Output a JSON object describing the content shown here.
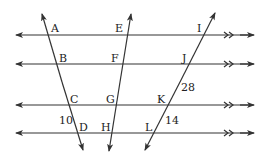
{
  "diagram": {
    "type": "parallel lines cut by transversals",
    "parallel_lines": [
      {
        "id": "line1",
        "y": 35,
        "marker": ">>"
      },
      {
        "id": "line2",
        "y": 64,
        "marker": ">>"
      },
      {
        "id": "line3",
        "y": 105,
        "marker": ">>"
      },
      {
        "id": "line4",
        "y": 133,
        "marker": ">>"
      }
    ],
    "transversals": [
      {
        "id": "t1",
        "points": [
          "A",
          "B",
          "C",
          "D"
        ]
      },
      {
        "id": "t2",
        "points": [
          "E",
          "F",
          "G",
          "H"
        ]
      },
      {
        "id": "t3",
        "points": [
          "I",
          "J",
          "K",
          "L"
        ]
      }
    ],
    "point_labels": {
      "A": "A",
      "B": "B",
      "C": "C",
      "D": "D",
      "E": "E",
      "F": "F",
      "G": "G",
      "H": "H",
      "I": "I",
      "J": "J",
      "K": "K",
      "L": "L"
    },
    "segment_labels": {
      "CD": "10",
      "JK": "28",
      "KL": "14"
    },
    "line_color": "#333333"
  }
}
